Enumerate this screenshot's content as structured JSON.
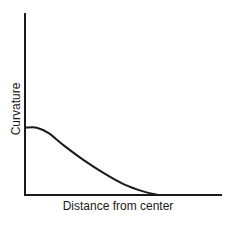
{
  "chart_data": {
    "type": "line",
    "title": "",
    "xlabel": "Distance from center",
    "ylabel": "Curvature",
    "grid": false,
    "legend": null,
    "ticks": {
      "x": [],
      "y": []
    },
    "xlim": [
      0,
      1
    ],
    "ylim": [
      0,
      1
    ],
    "series": [
      {
        "name": "curvature",
        "x": [
          0.0,
          0.06,
          0.12,
          0.2,
          0.3,
          0.4,
          0.5,
          0.6,
          0.68
        ],
        "y": [
          0.37,
          0.37,
          0.34,
          0.27,
          0.19,
          0.12,
          0.06,
          0.02,
          0.0
        ]
      }
    ]
  },
  "colors": {
    "axis": "#1a1a1a",
    "line": "#1a1a1a",
    "background": "#ffffff"
  }
}
